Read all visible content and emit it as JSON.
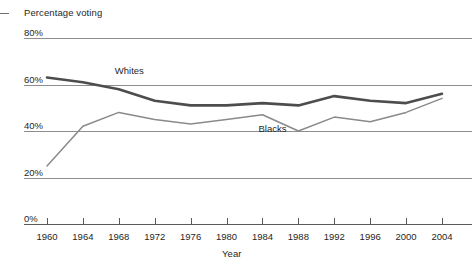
{
  "chart_data": {
    "type": "line",
    "title": "",
    "ylabel": "Percentage voting",
    "xlabel": "Year",
    "categories": [
      1960,
      1964,
      1968,
      1972,
      1976,
      1980,
      1984,
      1988,
      1992,
      1996,
      2000,
      2004
    ],
    "x_tick_labels": [
      "1960",
      "1964",
      "1968",
      "1972",
      "1976",
      "1980",
      "1984",
      "1988",
      "1992",
      "1996",
      "2000",
      "2004"
    ],
    "y_tick_labels": [
      "0%",
      "20%",
      "40%",
      "60%",
      "80%"
    ],
    "y_tick_values": [
      0,
      20,
      40,
      60,
      80
    ],
    "ylim": [
      0,
      80
    ],
    "xlim": [
      1960,
      2004
    ],
    "grid": true,
    "legend": "inline-labels",
    "series": [
      {
        "name": "Whites",
        "color": "#4d4d4d",
        "label_x": 1968,
        "label_y": 63,
        "values": [
          63,
          61,
          58,
          53,
          51,
          51,
          52,
          51,
          55,
          53,
          52,
          56
        ]
      },
      {
        "name": "Blacks",
        "color": "#8a8a8a",
        "label_x": 1984,
        "label_y": 38,
        "values": [
          25,
          42,
          48,
          45,
          43,
          45,
          47,
          40,
          46,
          44,
          48,
          54
        ]
      }
    ]
  },
  "labels": {
    "y_axis_title": "Percentage voting",
    "x_axis_title": "Year",
    "series_whites": "Whites",
    "series_blacks": "Blacks"
  }
}
